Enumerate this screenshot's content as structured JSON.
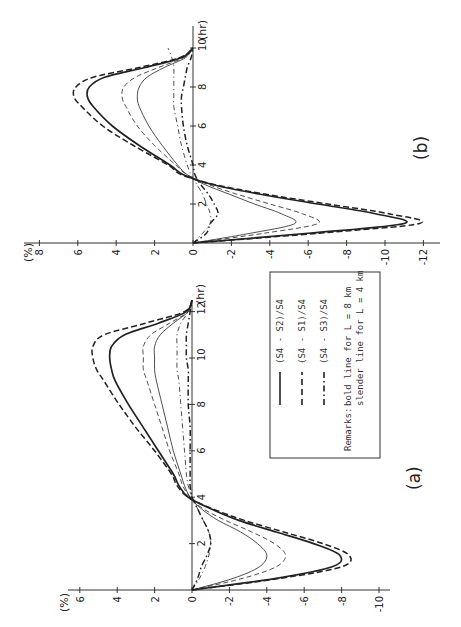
{
  "figure": {
    "orientation": "rotated 90 degrees counter-clockwise",
    "panel_a_label": "(a)",
    "panel_b_label": "(b)",
    "y_unit": "(%)",
    "x_unit": "(hr)",
    "legend": {
      "entries": [
        {
          "style": "solid",
          "label": "(S4 - S2)/S4"
        },
        {
          "style": "dashed",
          "label": "(S4 - S1)/S4"
        },
        {
          "style": "dash-dot",
          "label": "(S4 - S3)/S4"
        }
      ],
      "remarks_title": "Remarks:",
      "remarks_line1": "bold line for L = 8 km",
      "remarks_line2": "slender line for L = 4 km"
    }
  },
  "chart_data": [
    {
      "panel": "(a)",
      "type": "line",
      "xlabel": "(hr)",
      "ylabel": "(%)",
      "xlim": [
        0,
        12.5
      ],
      "ylim": [
        -10.5,
        6.5
      ],
      "x_ticks": [
        2,
        4,
        6,
        8,
        10,
        12
      ],
      "y_ticks": [
        6,
        4,
        2,
        0,
        -2,
        -4,
        -6,
        -8,
        -10
      ],
      "grid": false,
      "x": [
        0,
        0.5,
        1,
        1.5,
        2,
        2.5,
        3,
        3.5,
        4,
        4.5,
        5,
        6,
        7,
        8,
        9,
        9.5,
        10,
        10.5,
        11,
        11.5,
        12,
        12.5
      ],
      "series": [
        {
          "name": "(S4-S2)/S4 bold (L=8km)",
          "style": "solid-bold",
          "values": [
            0,
            -4.5,
            -7.5,
            -7.9,
            -6.5,
            -4.5,
            -2.5,
            -1.0,
            0.2,
            0.7,
            1.0,
            1.8,
            2.6,
            3.4,
            4.1,
            4.3,
            4.4,
            4.3,
            3.6,
            1.8,
            0.3,
            0
          ]
        },
        {
          "name": "(S4-S1)/S4 bold (L=8km)",
          "style": "dashed-bold",
          "values": [
            0,
            -4.7,
            -8.0,
            -8.4,
            -7.0,
            -4.9,
            -2.8,
            -1.1,
            0.2,
            0.8,
            1.1,
            2.0,
            3.0,
            3.9,
            4.7,
            5.1,
            5.3,
            5.3,
            4.7,
            2.5,
            0.4,
            0
          ]
        },
        {
          "name": "(S4-S3)/S4 bold (L=8km)",
          "style": "dashdot-bold",
          "values": [
            0,
            -0.3,
            -0.5,
            -0.8,
            -1.0,
            -0.9,
            -0.6,
            -0.3,
            0.0,
            0.1,
            0.1,
            0.1,
            0.1,
            0.2,
            0.2,
            0.2,
            0.3,
            0.3,
            0.3,
            0.2,
            0.1,
            0
          ]
        },
        {
          "name": "(S4-S2)/S4 slender (L=4km)",
          "style": "solid-thin",
          "values": [
            0,
            -2.2,
            -3.6,
            -4.0,
            -3.5,
            -2.6,
            -1.4,
            -0.5,
            0.1,
            0.4,
            0.6,
            1.0,
            1.3,
            1.6,
            1.9,
            2.0,
            2.0,
            2.0,
            1.7,
            1.0,
            0.2,
            0
          ]
        },
        {
          "name": "(S4-S1)/S4 slender (L=4km)",
          "style": "dashed-thin",
          "values": [
            0,
            -2.7,
            -4.5,
            -5.0,
            -4.4,
            -3.2,
            -1.8,
            -0.6,
            0.1,
            0.5,
            0.7,
            1.2,
            1.6,
            2.0,
            2.4,
            2.6,
            2.6,
            2.6,
            2.2,
            1.2,
            0.2,
            0
          ]
        },
        {
          "name": "(S4-S3)/S4 slender (L=4km)",
          "style": "dashdot-thin",
          "values": [
            0,
            -0.4,
            -0.7,
            -0.9,
            -1.0,
            -0.9,
            -0.6,
            -0.3,
            0.0,
            0.2,
            0.3,
            0.4,
            0.5,
            0.6,
            0.7,
            0.8,
            0.8,
            0.8,
            0.8,
            0.6,
            0.2,
            0
          ]
        }
      ]
    },
    {
      "panel": "(b)",
      "type": "line",
      "xlabel": "(hr)",
      "ylabel": "(%)",
      "xlim": [
        0,
        10.2
      ],
      "ylim": [
        -12.5,
        8.5
      ],
      "x_ticks": [
        2,
        4,
        6,
        8,
        10
      ],
      "y_ticks": [
        8,
        6,
        4,
        2,
        0,
        -2,
        -4,
        -6,
        -8,
        -10,
        -12
      ],
      "grid": false,
      "x": [
        0,
        0.5,
        1,
        1.5,
        2,
        2.5,
        3,
        3.5,
        4,
        5,
        6,
        7,
        7.5,
        8,
        8.5,
        9,
        9.5,
        10
      ],
      "series": [
        {
          "name": "(S4-S2)/S4 bold (L=8km)",
          "style": "solid-bold",
          "values": [
            0,
            -6.0,
            -11.0,
            -9.5,
            -6.5,
            -3.5,
            -1.0,
            0.5,
            1.2,
            2.8,
            4.2,
            5.2,
            5.5,
            5.4,
            4.6,
            2.5,
            0.6,
            0
          ]
        },
        {
          "name": "(S4-S1)/S4 bold (L=8km)",
          "style": "dashed-bold",
          "values": [
            0,
            -6.5,
            -11.8,
            -10.2,
            -7.0,
            -3.8,
            -1.1,
            0.6,
            1.3,
            3.1,
            4.7,
            5.8,
            6.2,
            6.1,
            5.2,
            2.8,
            0.7,
            0
          ]
        },
        {
          "name": "(S4-S3)/S4 bold (L=8km)",
          "style": "dashdot-bold",
          "values": [
            0,
            -0.7,
            -0.9,
            -1.3,
            -1.1,
            -0.8,
            -0.4,
            -0.1,
            0.0,
            0.3,
            0.5,
            0.6,
            0.6,
            0.5,
            0.4,
            0.3,
            0.1,
            0
          ]
        },
        {
          "name": "(S4-S2)/S4 slender (L=4km)",
          "style": "solid-thin",
          "values": [
            0,
            -3.0,
            -5.3,
            -4.6,
            -3.2,
            -1.9,
            -0.6,
            0.3,
            0.8,
            1.6,
            2.3,
            2.8,
            2.9,
            2.8,
            2.4,
            1.5,
            0.4,
            0
          ]
        },
        {
          "name": "(S4-S1)/S4 slender (L=4km)",
          "style": "dashed-thin",
          "values": [
            0,
            -3.7,
            -6.5,
            -5.7,
            -4.0,
            -2.3,
            -0.8,
            0.3,
            0.9,
            2.0,
            2.9,
            3.5,
            3.7,
            3.6,
            3.0,
            1.8,
            0.5,
            0
          ]
        },
        {
          "name": "(S4-S3)/S4 slender (L=4km)",
          "style": "dashdot-thin",
          "values": [
            0,
            -0.5,
            -0.9,
            -0.9,
            -0.7,
            -0.5,
            -0.2,
            0.1,
            0.3,
            0.6,
            0.8,
            1.0,
            1.0,
            1.0,
            1.0,
            1.0,
            1.1,
            1.3
          ]
        }
      ]
    }
  ]
}
